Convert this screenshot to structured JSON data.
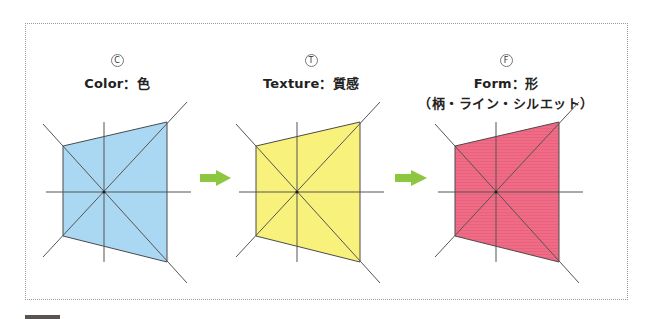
{
  "panels": [
    {
      "letter": "C",
      "title": "Color：色",
      "subtitle": "",
      "fill_color": "#aad8f3",
      "pattern": "solid",
      "center": [
        104,
        192
      ],
      "label_center_x": 117
    },
    {
      "letter": "T",
      "title": "Texture：質感",
      "subtitle": "",
      "fill_color": "#f8f27c",
      "pattern": "solid",
      "center": [
        297,
        192
      ],
      "label_center_x": 311
    },
    {
      "letter": "F",
      "title": "Form：形",
      "subtitle": "（柄・ライン・シルエット）",
      "fill_color": "#f06b86",
      "pattern": "horizontal-stripes",
      "center": [
        496,
        192
      ],
      "label_center_x": 506
    }
  ],
  "arrows": [
    {
      "from_x": 200,
      "to_x": 231,
      "y": 178,
      "color": "#8dc63f"
    },
    {
      "from_x": 395,
      "to_x": 427,
      "y": 178,
      "color": "#8dc63f"
    }
  ],
  "shape": {
    "description": "trapezoid with crosshair and extended diagonals",
    "relative_vertices": {
      "top_left": [
        -41,
        -46
      ],
      "top_right": [
        63,
        -70
      ],
      "bottom_right": [
        63,
        70
      ],
      "bottom_left": [
        -41,
        44
      ]
    },
    "axis_color": "#555555"
  }
}
